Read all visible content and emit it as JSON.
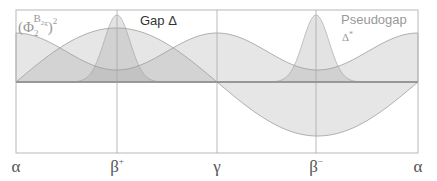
{
  "figure": {
    "width": 437,
    "height": 181,
    "frame": {
      "x0": 16,
      "x1": 418,
      "y0": 10,
      "y1": 153
    },
    "baseline_y": 82,
    "colors": {
      "frame": "#b8b8b8",
      "baseline": "#8c8c8c",
      "divider": "#a8a8a8",
      "fill_phi": "#9a9a9a",
      "fill_gap": "#9a9a9a",
      "fill_pseudogap": "#9a9a9a",
      "stroke": "#a0a0a0",
      "text_dark": "#333333",
      "text_light": "#999999",
      "axis_text": "#555555"
    }
  },
  "x_axis": {
    "ticks": [
      {
        "label": "α",
        "sup": "",
        "x": 16
      },
      {
        "label": "β",
        "sup": "+",
        "x": 117
      },
      {
        "label": "γ",
        "sup": "",
        "x": 217
      },
      {
        "label": "β",
        "sup": "−",
        "x": 316
      },
      {
        "label": "α",
        "sup": "",
        "x": 418
      }
    ]
  },
  "labels": {
    "phi": {
      "base": "(Φ",
      "sub": "2",
      "sup": "B",
      "supsub": "2g",
      "close": ")",
      "power": "2"
    },
    "gap": {
      "text": "Gap Δ"
    },
    "pseudogap": {
      "line1": "Pseudogap",
      "line2": "Δ",
      "line2_sup": "*"
    }
  },
  "curves": {
    "phi_squared": {
      "name": "(Φ2^B2g)^2",
      "max_height": 49,
      "min_height": 12,
      "shape": "cos^2 envelope, peaks at α, γ, α; minima at β+, β−"
    },
    "gap": {
      "name": "Gap Δ",
      "amplitude": 54,
      "shape": "sin, positive lobe α→γ (max at β+), negative lobe γ→α (min at β−)"
    },
    "pseudogap": {
      "name": "Pseudogap Δ*",
      "peak_height": 67,
      "sigma": 13,
      "centers": [
        117,
        316
      ]
    }
  }
}
